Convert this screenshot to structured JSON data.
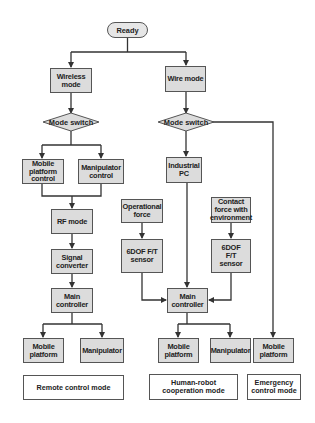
{
  "diagram": {
    "start": "Ready",
    "left_branch": {
      "mode": "Wireless mode",
      "decision": "Mode switch",
      "options": [
        "Mobile platform control",
        "Manipulator control"
      ],
      "chain": [
        "RF mode",
        "Signal converter",
        "Main controller"
      ],
      "outputs": [
        "Mobile platform",
        "Manipulator"
      ],
      "caption": "Remote control mode"
    },
    "right_branch": {
      "mode": "Wire mode",
      "decision": "Mode switch",
      "pc": "Industrial PC",
      "inputs": [
        {
          "source": "Operational force",
          "sensor": "6DOF F/T sensor"
        },
        {
          "source": "Contact force with environment",
          "sensor": "6DOF F/T sensor"
        }
      ],
      "controller": "Main controller",
      "outputs": [
        "Mobile platform",
        "Manipulator"
      ],
      "caption": "Human-robot cooperation mode"
    },
    "emergency_branch": {
      "output": "Mobile platform",
      "caption": "Emergency control mode"
    }
  },
  "colors": {
    "box_fill": "#dcdcdc",
    "border": "#555555",
    "line": "#333333",
    "caption_fill": "#ffffff"
  }
}
